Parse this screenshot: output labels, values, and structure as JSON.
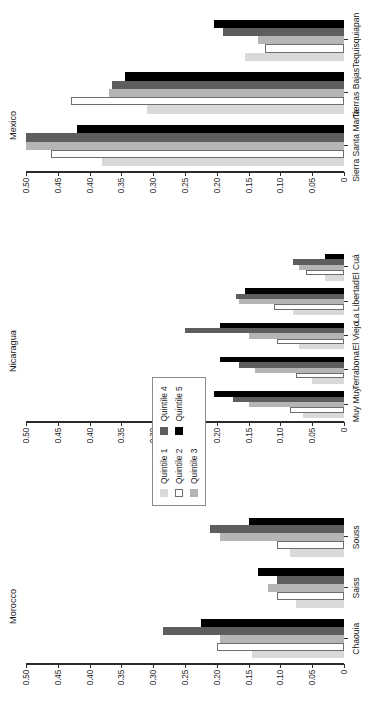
{
  "chart_data": {
    "type": "bar",
    "title": "",
    "orientation": "vertical-grouped",
    "ylabel": "",
    "xlabel": "",
    "ylim": [
      0,
      0.5
    ],
    "yticks": [
      "0",
      "0.05",
      "0.10",
      "0.15",
      "0.20",
      "0.25",
      "0.30",
      "0.35",
      "0.40",
      "0.45",
      "0.50"
    ],
    "ytick_values": [
      0,
      0.05,
      0.1,
      0.15,
      0.2,
      0.25,
      0.3,
      0.35,
      0.4,
      0.45,
      0.5
    ],
    "grid": false,
    "legend_position": "center",
    "legend": [
      "Quintile 1",
      "Quintile 2",
      "Quintile 3",
      "Quintile 4",
      "Quintile 5"
    ],
    "series_colors": [
      "#d9d9d9",
      "#ffffff",
      "#b5b5b5",
      "#5e5e5e",
      "#000000"
    ],
    "panels": [
      {
        "name": "Morocco",
        "categories": [
          "Chaouia",
          "Saiss",
          "Souss"
        ],
        "series": [
          {
            "name": "Quintile 1",
            "values": [
              0.145,
              0.075,
              0.085
            ]
          },
          {
            "name": "Quintile 2",
            "values": [
              0.2,
              0.105,
              0.105
            ]
          },
          {
            "name": "Quintile 3",
            "values": [
              0.195,
              0.12,
              0.195
            ]
          },
          {
            "name": "Quintile 4",
            "values": [
              0.285,
              0.105,
              0.21
            ]
          },
          {
            "name": "Quintile 5",
            "values": [
              0.225,
              0.135,
              0.15
            ]
          }
        ]
      },
      {
        "name": "Nicaragua",
        "categories": [
          "Muy Muy",
          "Terrabona",
          "El Viejo",
          "La Libertad",
          "El Cuá"
        ],
        "series": [
          {
            "name": "Quintile 1",
            "values": [
              0.065,
              0.05,
              0.07,
              0.08,
              0.03
            ]
          },
          {
            "name": "Quintile 2",
            "values": [
              0.085,
              0.075,
              0.105,
              0.11,
              0.06
            ]
          },
          {
            "name": "Quintile 3",
            "values": [
              0.15,
              0.14,
              0.15,
              0.165,
              0.07
            ]
          },
          {
            "name": "Quintile 4",
            "values": [
              0.175,
              0.165,
              0.25,
              0.17,
              0.08
            ]
          },
          {
            "name": "Quintile 5",
            "values": [
              0.205,
              0.195,
              0.195,
              0.155,
              0.03
            ]
          }
        ]
      },
      {
        "name": "Mexico",
        "categories": [
          "Sierra Santa Marta",
          "Tierras Bajas",
          "Tequisquiapan"
        ],
        "series": [
          {
            "name": "Quintile 1",
            "values": [
              0.38,
              0.31,
              0.155
            ]
          },
          {
            "name": "Quintile 2",
            "values": [
              0.46,
              0.43,
              0.125
            ]
          },
          {
            "name": "Quintile 3",
            "values": [
              0.5,
              0.37,
              0.135
            ]
          },
          {
            "name": "Quintile 4",
            "values": [
              0.5,
              0.365,
              0.19
            ]
          },
          {
            "name": "Quintile 5",
            "values": [
              0.42,
              0.345,
              0.205
            ]
          }
        ]
      }
    ]
  }
}
